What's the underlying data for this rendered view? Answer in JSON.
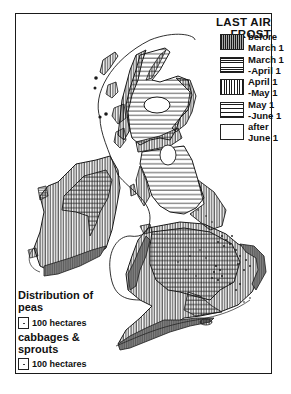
{
  "map": {
    "title": "LAST AIR FROST",
    "region": "British Isles",
    "legend": [
      {
        "label": "before\nMarch 1",
        "pattern": "dense-vertical"
      },
      {
        "label": "March 1\n-April 1",
        "pattern": "dense-horizontal"
      },
      {
        "label": "April 1\n-May 1",
        "pattern": "vertical"
      },
      {
        "label": "May 1\n-June 1",
        "pattern": "horizontal"
      },
      {
        "label": "after\nJune 1",
        "pattern": "blank"
      }
    ],
    "distribution": {
      "title_line1": "Distribution of",
      "title_line2": "peas",
      "peas_scale": "100 hectares",
      "crop2_line1": "cabbages &",
      "crop2_line2": "sprouts",
      "cabbages_scale": "100 hectares"
    }
  },
  "colors": {
    "ink": "#1a1a1a",
    "background": "#ffffff"
  }
}
